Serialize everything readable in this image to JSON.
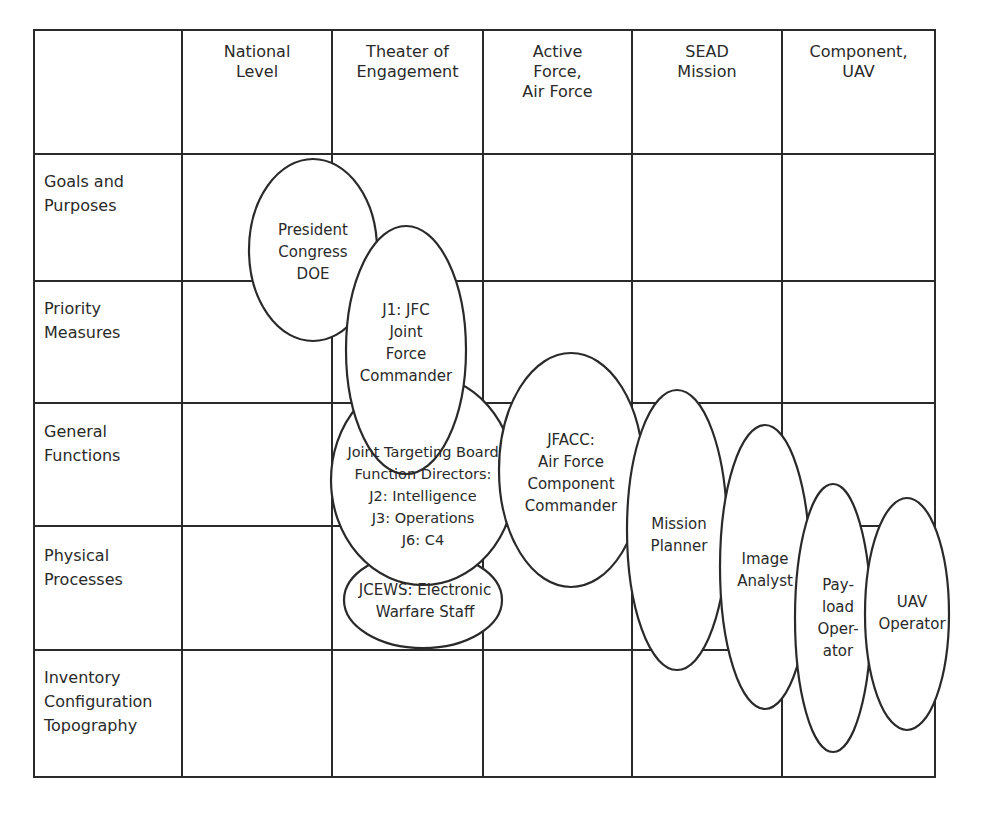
{
  "columns": [
    {
      "label": "National\nLevel",
      "x": 257
    },
    {
      "label": "Theater of\nEngagement",
      "x": 407
    },
    {
      "label": "Active\nForce,\nAir Force",
      "x": 558
    },
    {
      "label": "SEAD\nMission",
      "x": 707
    },
    {
      "label": "Component,\nUAV",
      "x": 858
    }
  ],
  "rows": [
    {
      "label": "Goals and\nPurposes",
      "y": 168
    },
    {
      "label": "Priority\nMeasures",
      "y": 295
    },
    {
      "label": "General\nFunctions",
      "y": 418
    },
    {
      "label": "Physical\nProcesses",
      "y": 541
    },
    {
      "label": "Inventory\nConfiguration\nTopography",
      "y": 664
    }
  ],
  "ellipses": [
    {
      "id": "president",
      "label": "President\nCongress\nDOE",
      "cx": 313,
      "cy": 250,
      "rx": 64,
      "ry": 91
    },
    {
      "id": "jfc",
      "label": "J1: JFC\nJoint\nForce\nCommander",
      "cx": 406,
      "cy": 350,
      "rx": 60,
      "ry": 124
    },
    {
      "id": "jtb",
      "label": "Joint Targeting Board\nFunction Directors:\nJ2: Intelligence\nJ3: Operations\nJ6: C4",
      "cx": 423,
      "cy": 480,
      "rx": 92,
      "ry": 105
    },
    {
      "id": "jcews",
      "label": "JCEWS: Electronic\nWarfare Staff",
      "cx": 423,
      "cy": 600,
      "rx": 79,
      "ry": 48
    },
    {
      "id": "jfacc",
      "label": "JFACC:\nAir Force\nComponent\nCommander",
      "cx": 571,
      "cy": 470,
      "rx": 72,
      "ry": 117
    },
    {
      "id": "mission-planner",
      "label": "Mission\nPlanner",
      "cx": 677,
      "cy": 530,
      "rx": 50,
      "ry": 140
    },
    {
      "id": "image-analyst",
      "label": "Image\nAnalyst",
      "cx": 765,
      "cy": 567,
      "rx": 45,
      "ry": 142
    },
    {
      "id": "payload-operator",
      "label": "Pay-\nload\nOper-\nator",
      "cx": 833,
      "cy": 618,
      "rx": 38,
      "ry": 134
    },
    {
      "id": "uav-operator",
      "label": "UAV\nOperator",
      "cx": 907,
      "cy": 614,
      "rx": 42,
      "ry": 116
    }
  ]
}
